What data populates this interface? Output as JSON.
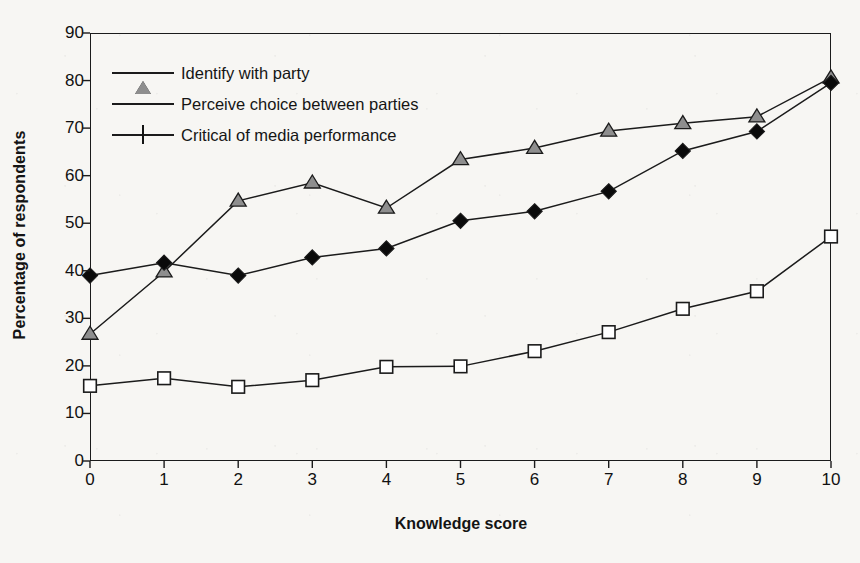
{
  "chart_data": {
    "type": "line",
    "title": "",
    "xlabel": "Knowledge score",
    "ylabel": "Percentage of respondents",
    "x": [
      0,
      1,
      2,
      3,
      4,
      5,
      6,
      7,
      8,
      9,
      10
    ],
    "xtick_labels": [
      "0",
      "1",
      "2",
      "3",
      "4",
      "5",
      "6",
      "7",
      "8",
      "9",
      "10"
    ],
    "ytick_labels": [
      "0",
      "10",
      "20",
      "30",
      "40",
      "50",
      "60",
      "70",
      "80",
      "90"
    ],
    "xlim": [
      0,
      10
    ],
    "ylim": [
      0,
      90
    ],
    "grid": false,
    "legend_position": "top-left",
    "series": [
      {
        "name": "Identify with party",
        "marker": "triangle",
        "marker_fill": "#8e8e8e",
        "line_color": "#1b1b1b",
        "values": [
          26.7,
          39.8,
          54.7,
          58.5,
          53.2,
          63.4,
          65.8,
          69.4,
          71.0,
          72.4,
          80.6
        ]
      },
      {
        "name": "Perceive choice between parties",
        "marker": "diamond",
        "marker_fill": "#0a0a0a",
        "line_color": "#1b1b1b",
        "values": [
          39.0,
          41.7,
          39.0,
          42.8,
          44.7,
          50.5,
          52.5,
          56.7,
          65.2,
          69.3,
          79.5
        ]
      },
      {
        "name": "Critical of media performance",
        "marker": "square",
        "marker_fill": "#ffffff",
        "line_color": "#1b1b1b",
        "values": [
          15.8,
          17.4,
          15.6,
          17.0,
          19.8,
          19.9,
          23.1,
          27.1,
          32.0,
          35.7,
          47.2
        ]
      }
    ]
  },
  "colors": {
    "background": "#f7f6f3",
    "axis": "#1b1b1b",
    "text": "#141414",
    "triangle_fill": "#8e8e8e",
    "diamond_fill": "#0a0a0a",
    "square_fill": "#ffffff"
  }
}
